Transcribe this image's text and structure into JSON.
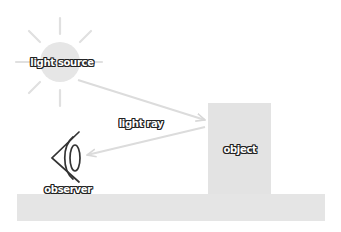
{
  "diagram": {
    "labels": {
      "light_source": "light source",
      "light_ray": "light ray",
      "object": "object",
      "observer": "observer"
    },
    "colors": {
      "background": "#ffffff",
      "sun_fill": "#e6e6e6",
      "sun_rays": "#e0e0e0",
      "ray_line": "#dcdcdc",
      "object_fill": "#e3e3e3",
      "ground_fill": "#e5e5e5",
      "eye_stroke": "#333333",
      "label_text": "#ffffff",
      "label_outline": "#222222"
    },
    "elements": [
      {
        "id": "light-source",
        "shape": "circle with 8 rays",
        "center": [
          60,
          62
        ]
      },
      {
        "id": "object",
        "shape": "square",
        "x": 208,
        "y": 103,
        "w": 63,
        "h": 91
      },
      {
        "id": "ground",
        "shape": "rectangle",
        "x": 17,
        "y": 194,
        "w": 308,
        "h": 27
      },
      {
        "id": "observer",
        "shape": "eye icon",
        "center": [
          68,
          158
        ]
      }
    ],
    "arrows": [
      {
        "from": "light-source",
        "to": "object"
      },
      {
        "from": "object",
        "to": "observer"
      }
    ]
  }
}
